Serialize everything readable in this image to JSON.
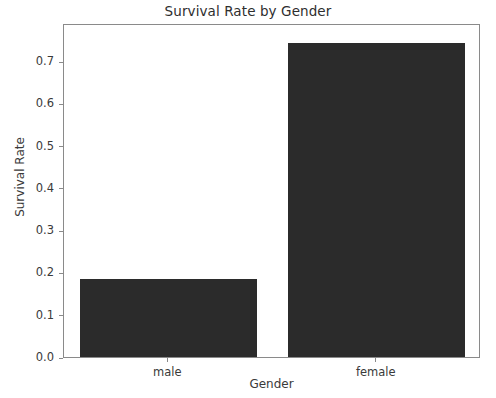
{
  "chart_data": {
    "type": "bar",
    "title": "Survival Rate by Gender",
    "xlabel": "Gender",
    "ylabel": "Survival Rate",
    "categories": [
      "male",
      "female"
    ],
    "values": [
      0.185,
      0.742
    ],
    "ylim": [
      0.0,
      0.79
    ],
    "yticks": [
      0.0,
      0.1,
      0.2,
      0.3,
      0.4,
      0.5,
      0.6,
      0.7
    ],
    "ytick_labels": [
      "0.0",
      "0.1",
      "0.2",
      "0.3",
      "0.4",
      "0.5",
      "0.6",
      "0.7"
    ],
    "grid": false,
    "legend": null,
    "bar_color": "#2b2b2b",
    "axes_color": "#8a8a8a",
    "text_color": "#3a3a3a",
    "background": "#ffffff"
  }
}
